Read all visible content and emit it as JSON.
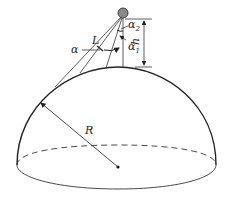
{
  "diagram": {
    "labels": {
      "radius": "R",
      "height": "h",
      "sight_line": "L",
      "angle": "α",
      "angle1": "α",
      "angle1_sub": "1",
      "angle2": "α",
      "angle2_sub": "2"
    },
    "colors": {
      "stroke": "#222222",
      "observer_fill": "#8a8a8a",
      "background": "#ffffff"
    }
  }
}
